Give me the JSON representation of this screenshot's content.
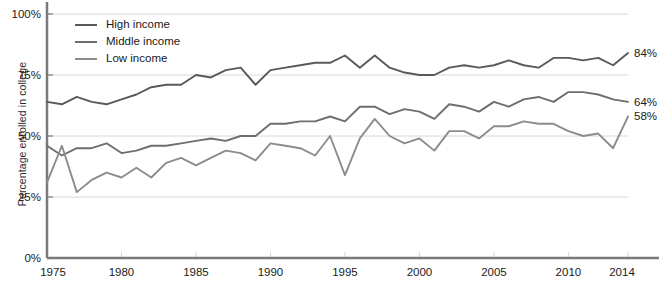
{
  "chart_data": {
    "type": "line",
    "title": "",
    "xlabel": "",
    "ylabel": "Percentage enrolled in college",
    "xlim": [
      1975,
      2014
    ],
    "ylim": [
      0,
      100
    ],
    "grid": true,
    "legend_position": "top-left",
    "y_ticks": [
      "0%",
      "25%",
      "50%",
      "75%",
      "100%"
    ],
    "y_tick_values": [
      0,
      25,
      50,
      75,
      100
    ],
    "x_ticks": [
      "1975",
      "1980",
      "1985",
      "1990",
      "1995",
      "2000",
      "2005",
      "2010",
      "2014"
    ],
    "x_tick_values": [
      1975,
      1980,
      1985,
      1990,
      1995,
      2000,
      2005,
      2010,
      2014
    ],
    "x": [
      1975,
      1976,
      1977,
      1978,
      1979,
      1980,
      1981,
      1982,
      1983,
      1984,
      1985,
      1986,
      1987,
      1988,
      1989,
      1990,
      1991,
      1992,
      1993,
      1994,
      1995,
      1996,
      1997,
      1998,
      1999,
      2000,
      2001,
      2002,
      2003,
      2004,
      2005,
      2006,
      2007,
      2008,
      2009,
      2010,
      2011,
      2012,
      2013,
      2014
    ],
    "series": [
      {
        "name": "High income",
        "color": "#595959",
        "end_label": "84%",
        "values": [
          64,
          63,
          66,
          64,
          63,
          65,
          67,
          70,
          71,
          71,
          75,
          74,
          77,
          78,
          71,
          77,
          78,
          79,
          80,
          80,
          83,
          78,
          83,
          78,
          76,
          75,
          75,
          78,
          79,
          78,
          79,
          81,
          79,
          78,
          82,
          82,
          81,
          82,
          79,
          84
        ]
      },
      {
        "name": "Middle income",
        "color": "#6e6e6e",
        "end_label": "64%",
        "values": [
          46,
          42,
          45,
          45,
          47,
          43,
          44,
          46,
          46,
          47,
          48,
          49,
          48,
          50,
          50,
          55,
          55,
          56,
          56,
          58,
          56,
          62,
          62,
          59,
          61,
          60,
          57,
          63,
          62,
          60,
          64,
          62,
          65,
          66,
          64,
          68,
          68,
          67,
          65,
          64
        ]
      },
      {
        "name": "Low income",
        "color": "#8c8c8c",
        "end_label": "58%",
        "values": [
          31,
          46,
          27,
          32,
          35,
          33,
          37,
          33,
          39,
          41,
          38,
          41,
          44,
          43,
          40,
          47,
          46,
          45,
          42,
          50,
          34,
          49,
          57,
          50,
          47,
          49,
          44,
          52,
          52,
          49,
          54,
          54,
          56,
          55,
          55,
          52,
          50,
          51,
          45,
          58
        ]
      }
    ]
  },
  "axis": {
    "axis_color": "#7a7a7a",
    "grid_color": "#d8d8d8"
  }
}
